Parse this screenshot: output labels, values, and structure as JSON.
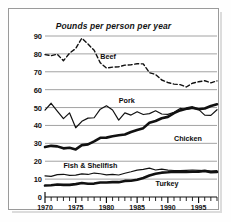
{
  "figure": {
    "title": "Pounds per person per year",
    "frame_color": "#9a9a9a",
    "background": "#ffffff",
    "ink_color": "#111111",
    "gridline_color": "#8c8c8c"
  },
  "chart_data": {
    "type": "line",
    "title": "Pounds per person per year",
    "xlabel": "",
    "ylabel": "",
    "xlim": [
      1970,
      1998
    ],
    "ylim": [
      0,
      90
    ],
    "grid": true,
    "legend_position": "inline-labels",
    "xticks": [
      1970,
      1975,
      1980,
      1985,
      1990,
      1995
    ],
    "xticks_minor_step": 1,
    "yticks": [
      0,
      10,
      20,
      30,
      40,
      50,
      60,
      70,
      80,
      90
    ],
    "x": [
      1970,
      1971,
      1972,
      1973,
      1974,
      1975,
      1976,
      1977,
      1978,
      1979,
      1980,
      1981,
      1982,
      1983,
      1984,
      1985,
      1986,
      1987,
      1988,
      1989,
      1990,
      1991,
      1992,
      1993,
      1994,
      1995,
      1996,
      1997,
      1998
    ],
    "series": [
      {
        "name": "Beef",
        "style": "dashed",
        "width": 1.4,
        "label_x": 1979,
        "label_y": 79,
        "values": [
          79.6,
          79.0,
          79.8,
          76.2,
          80.4,
          83.0,
          88.8,
          85.5,
          82.0,
          75.0,
          72.1,
          72.6,
          72.8,
          73.7,
          73.9,
          74.5,
          74.4,
          69.5,
          68.5,
          65.4,
          64.0,
          63.1,
          62.8,
          61.5,
          63.6,
          64.4,
          65.0,
          63.8,
          64.9
        ]
      },
      {
        "name": "Pork",
        "style": "solid-thin",
        "width": 1.2,
        "label_x": 1982,
        "label_y": 54,
        "values": [
          48.6,
          52.4,
          48.0,
          43.8,
          47.0,
          38.7,
          42.3,
          44.1,
          44.3,
          49.1,
          51.0,
          48.6,
          43.0,
          47.0,
          45.8,
          47.7,
          46.1,
          46.6,
          48.2,
          46.4,
          46.2,
          47.4,
          49.5,
          48.9,
          49.5,
          49.0,
          45.8,
          45.6,
          48.8
        ]
      },
      {
        "name": "Chicken",
        "style": "solid-thick",
        "width": 2.6,
        "label_x": 1991,
        "label_y": 33,
        "values": [
          27.9,
          28.6,
          28.3,
          27.2,
          27.5,
          26.6,
          29.0,
          29.4,
          31.1,
          33.1,
          33.2,
          34.0,
          34.5,
          34.9,
          36.3,
          37.5,
          38.5,
          41.5,
          42.5,
          44.0,
          44.8,
          46.9,
          48.4,
          49.4,
          50.1,
          49.1,
          49.5,
          50.9,
          51.8
        ]
      },
      {
        "name": "Fish & Shellfish",
        "style": "solid-thin",
        "width": 1.2,
        "label_x": 1973,
        "label_y": 18,
        "values": [
          11.8,
          11.5,
          12.5,
          12.7,
          12.1,
          12.2,
          12.9,
          12.6,
          13.4,
          13.0,
          12.4,
          12.6,
          12.3,
          13.3,
          14.1,
          15.0,
          15.4,
          16.1,
          15.1,
          15.6,
          15.0,
          14.8,
          14.7,
          14.9,
          15.1,
          14.9,
          14.7,
          14.5,
          14.8
        ]
      },
      {
        "name": "Turkey",
        "style": "solid-thick",
        "width": 2.6,
        "label_x": 1988,
        "label_y": 8,
        "values": [
          6.4,
          6.6,
          7.0,
          6.8,
          6.8,
          7.2,
          7.8,
          7.4,
          7.5,
          8.1,
          8.1,
          8.3,
          8.3,
          9.0,
          9.1,
          9.6,
          10.6,
          12.0,
          13.0,
          13.6,
          13.8,
          14.1,
          14.0,
          14.0,
          14.1,
          14.1,
          14.6,
          13.9,
          14.0
        ]
      }
    ]
  }
}
